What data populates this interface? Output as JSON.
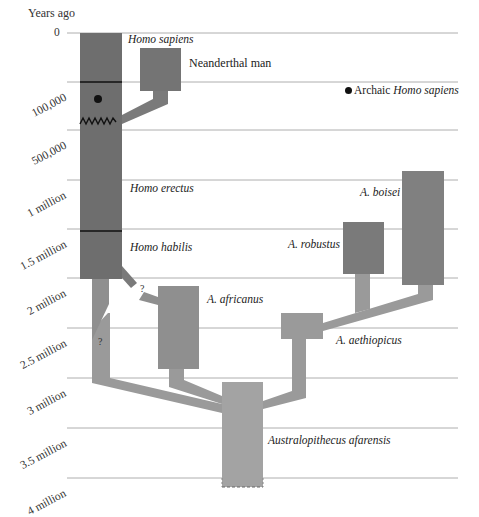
{
  "axis": {
    "title": "Years ago",
    "ticks": [
      {
        "label": "0",
        "y": 33
      },
      {
        "label": "100,000",
        "y": 82
      },
      {
        "label": "500,000",
        "y": 130
      },
      {
        "label": "1 million",
        "y": 180
      },
      {
        "label": "1.5 million",
        "y": 229
      },
      {
        "label": "2 million",
        "y": 278
      },
      {
        "label": "2.5 million",
        "y": 328
      },
      {
        "label": "3 million",
        "y": 378
      },
      {
        "label": "3.5 million",
        "y": 428
      },
      {
        "label": "4 million",
        "y": 478
      }
    ]
  },
  "species": {
    "homo_sapiens": "Homo sapiens",
    "neanderthal": "Neanderthal man",
    "homo_erectus": "Homo erectus",
    "homo_habilis": "Homo habilis",
    "a_africanus": "A. africanus",
    "a_boisei": "A. boisei",
    "a_robustus": "A. robustus",
    "a_aethiopicus": "A. aethiopicus",
    "a_afarensis": "Australopithecus afarensis"
  },
  "legend": {
    "prefix": "Archaic ",
    "italic": "Homo sapiens"
  },
  "uncertain_marks": [
    "?",
    "?"
  ],
  "colors": {
    "homo_dark": "#6b6b6b",
    "neanderthal": "#747474",
    "robust": "#7a7a7a",
    "boisei": "#808080",
    "branch": "#9a9a9a",
    "afarensis": "#a3a3a3",
    "gridline": "#999999"
  }
}
